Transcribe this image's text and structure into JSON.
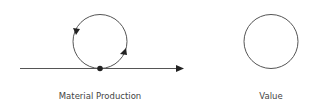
{
  "diagram": {
    "left": {
      "label": "Material Production",
      "elements": [
        "horizontal-arrow",
        "cycle-circle-with-arrows",
        "contact-dot"
      ]
    },
    "right": {
      "label": "Value",
      "elements": [
        "circle"
      ]
    }
  },
  "colors": {
    "stroke": "#555555",
    "fill": "#222222",
    "text": "#444444"
  }
}
